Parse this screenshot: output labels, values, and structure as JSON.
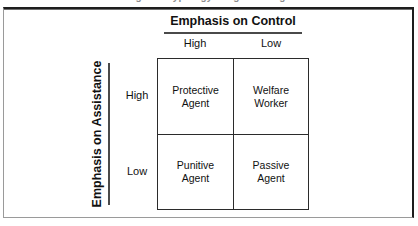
{
  "clipped_caption": "igure ... ypology ... agent ... ing",
  "figure": {
    "column_axis": {
      "title": "Emphasis on Control",
      "ticks": [
        "High",
        "Low"
      ]
    },
    "row_axis": {
      "title": "Emphasis on Assistance",
      "ticks": [
        "High",
        "Low"
      ]
    },
    "quadrants": [
      {
        "id": "high-assistance-high-control",
        "label": "Protective\nAgent"
      },
      {
        "id": "high-assistance-low-control",
        "label": "Welfare\nWorker"
      },
      {
        "id": "low-assistance-high-control",
        "label": "Punitive\nAgent"
      },
      {
        "id": "low-assistance-low-control",
        "label": "Passive\nAgent"
      }
    ]
  },
  "colors": {
    "ink": "#111111",
    "rule": "#4a4a4a",
    "matrix_border": "#2b2b2b",
    "frame_dark": "#1d1d1d",
    "frame_light": "#9a9a9a",
    "page": "#ffffff"
  }
}
